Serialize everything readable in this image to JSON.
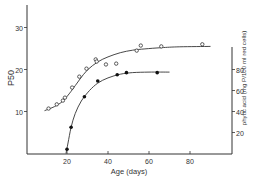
{
  "chart_data": {
    "type": "line",
    "title": "",
    "xlabel": "Age (days)",
    "ylabel": "P50",
    "y2label": "phytic acid (mg P/100 ml red cells)",
    "xlim": [
      0,
      100
    ],
    "ylim": [
      0,
      35
    ],
    "y2lim": [
      0,
      100
    ],
    "x_ticks": [
      20,
      40,
      60,
      80
    ],
    "y_ticks": [
      10,
      20,
      30
    ],
    "y2_ticks": [
      20,
      40,
      60,
      80
    ],
    "grid": false,
    "legend": null,
    "series": [
      {
        "name": "P50",
        "axis": "left",
        "marker": "open-circle",
        "points": [
          {
            "x": 11,
            "y": 10.7
          },
          {
            "x": 15,
            "y": 11.7
          },
          {
            "x": 18,
            "y": 12.6
          },
          {
            "x": 19,
            "y": 13.3
          },
          {
            "x": 22.5,
            "y": 15.7
          },
          {
            "x": 26,
            "y": 18.3
          },
          {
            "x": 29.5,
            "y": 20.2
          },
          {
            "x": 34,
            "y": 22.4
          },
          {
            "x": 34.5,
            "y": 21.9
          },
          {
            "x": 39,
            "y": 21.2
          },
          {
            "x": 44,
            "y": 21.4
          },
          {
            "x": 54,
            "y": 24.5
          },
          {
            "x": 56,
            "y": 25.7
          },
          {
            "x": 66,
            "y": 25.5
          },
          {
            "x": 86,
            "y": 26
          }
        ],
        "curve": [
          [
            9,
            10.2
          ],
          [
            14,
            11.2
          ],
          [
            18,
            12.5
          ],
          [
            22,
            14.8
          ],
          [
            26,
            17.5
          ],
          [
            30,
            19.9
          ],
          [
            35,
            21.8
          ],
          [
            40,
            23.0
          ],
          [
            46,
            24.0
          ],
          [
            52,
            24.6
          ],
          [
            58,
            24.9
          ],
          [
            66,
            25.2
          ],
          [
            75,
            25.4
          ],
          [
            90,
            25.5
          ]
        ]
      },
      {
        "name": "phytic acid",
        "axis": "right",
        "marker": "filled-circle",
        "points": [
          {
            "x": 20,
            "y": 4
          },
          {
            "x": 22,
            "y": 25
          },
          {
            "x": 28.5,
            "y": 54
          },
          {
            "x": 35,
            "y": 69
          },
          {
            "x": 44.5,
            "y": 75
          },
          {
            "x": 49,
            "y": 77
          },
          {
            "x": 64,
            "y": 77
          }
        ],
        "curve": [
          [
            19.5,
            0
          ],
          [
            20.5,
            10
          ],
          [
            22,
            25
          ],
          [
            24,
            38
          ],
          [
            27,
            50
          ],
          [
            31,
            60
          ],
          [
            35,
            67
          ],
          [
            40,
            72
          ],
          [
            46,
            75.5
          ],
          [
            52,
            77
          ],
          [
            60,
            77.5
          ],
          [
            70,
            77.5
          ]
        ]
      }
    ]
  },
  "labels": {
    "xlabel": "Age (days)",
    "ylabel_left": "P50",
    "ylabel_right": "phytic acid (mg P/100 ml red cells)",
    "x_tick_labels": [
      "20",
      "40",
      "60",
      "80"
    ],
    "y_tick_labels": [
      "10",
      "20",
      "30"
    ],
    "y2_tick_labels": [
      "20",
      "40",
      "60",
      "80"
    ]
  },
  "colors": {
    "ink": "#333333",
    "background": "#ffffff"
  }
}
